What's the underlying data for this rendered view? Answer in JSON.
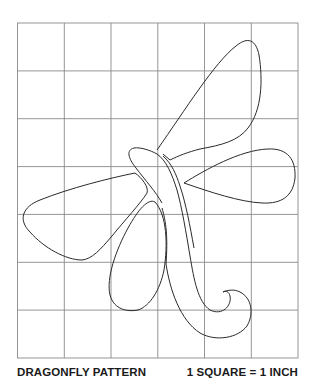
{
  "title": "DRAGONFLY PATTERN",
  "scale_note": "1 SQUARE = 1 INCH",
  "grid": {
    "columns": 6,
    "rows": 7,
    "line_color": "#8a8a8a",
    "outline_color": "#2a2a2a"
  },
  "parts": [
    "upper-right-wing",
    "right-wing",
    "left-wing",
    "lower-left-wing",
    "body",
    "tail-hook"
  ]
}
